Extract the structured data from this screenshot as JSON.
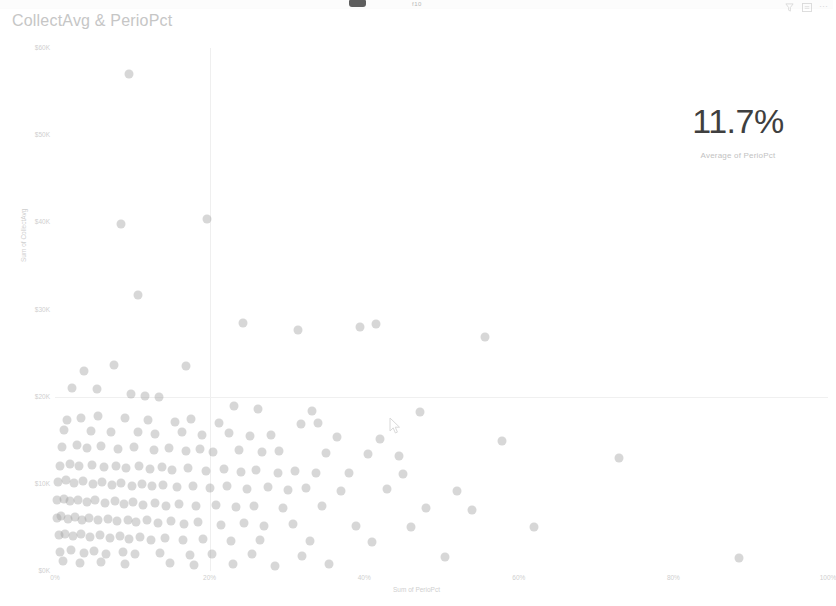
{
  "window": {
    "chrome_hint": "f10"
  },
  "visual": {
    "title": "CollectAvg & PerioPct",
    "header_icons": [
      {
        "name": "filter-icon",
        "glyph": "filter"
      },
      {
        "name": "focus-mode-icon",
        "glyph": "focus"
      },
      {
        "name": "more-options-icon",
        "glyph": "⋯"
      }
    ]
  },
  "kpi": {
    "value": "11.7%",
    "label": "Average of PerioPct"
  },
  "chart_data": {
    "type": "scatter",
    "title": "CollectAvg & PerioPct",
    "xlabel": "Sum of PerioPct",
    "ylabel": "Sum of CollectAvg",
    "xlim": [
      0,
      100
    ],
    "ylim": [
      0,
      60000
    ],
    "x_ticks": [
      0,
      20,
      40,
      60,
      80,
      100
    ],
    "x_tick_labels": [
      "0%",
      "20%",
      "40%",
      "60%",
      "80%",
      "100%"
    ],
    "y_ticks": [
      0,
      10000,
      20000,
      30000,
      40000,
      50000,
      60000
    ],
    "y_tick_labels": [
      "$0K",
      "$10K",
      "$20K",
      "$30K",
      "$40K",
      "$50K",
      "$60K"
    ],
    "grid": true,
    "legend": "none",
    "marker_color": "#9a9a9a",
    "marker_opacity": 0.4,
    "marker_size": 9,
    "points": [
      [
        9.6,
        57000
      ],
      [
        8.5,
        39800
      ],
      [
        19.7,
        40400
      ],
      [
        10.8,
        31700
      ],
      [
        24.3,
        28400
      ],
      [
        31.4,
        27600
      ],
      [
        39.5,
        28000
      ],
      [
        41.5,
        28300
      ],
      [
        55.6,
        26800
      ],
      [
        3.7,
        22900
      ],
      [
        7.6,
        23600
      ],
      [
        17.0,
        23500
      ],
      [
        2.2,
        21000
      ],
      [
        5.4,
        20900
      ],
      [
        9.8,
        20300
      ],
      [
        11.6,
        20100
      ],
      [
        13.5,
        20000
      ],
      [
        23.1,
        18900
      ],
      [
        26.3,
        18600
      ],
      [
        33.3,
        18400
      ],
      [
        47.2,
        18200
      ],
      [
        1.6,
        17300
      ],
      [
        3.3,
        17600
      ],
      [
        5.5,
        17800
      ],
      [
        9.0,
        17500
      ],
      [
        12.0,
        17300
      ],
      [
        15.5,
        17100
      ],
      [
        17.6,
        17400
      ],
      [
        21.2,
        17000
      ],
      [
        31.8,
        16900
      ],
      [
        34.0,
        17000
      ],
      [
        1.2,
        16200
      ],
      [
        4.6,
        16100
      ],
      [
        7.2,
        15900
      ],
      [
        10.7,
        16000
      ],
      [
        13.0,
        15700
      ],
      [
        16.4,
        15900
      ],
      [
        19.0,
        15600
      ],
      [
        22.5,
        15800
      ],
      [
        25.2,
        15500
      ],
      [
        28.0,
        15600
      ],
      [
        36.5,
        15400
      ],
      [
        42.0,
        15100
      ],
      [
        57.8,
        14900
      ],
      [
        0.9,
        14200
      ],
      [
        2.8,
        14400
      ],
      [
        4.2,
        14100
      ],
      [
        6.0,
        14300
      ],
      [
        8.2,
        14000
      ],
      [
        10.2,
        14200
      ],
      [
        12.8,
        13900
      ],
      [
        14.7,
        14100
      ],
      [
        16.9,
        13800
      ],
      [
        18.8,
        14000
      ],
      [
        20.5,
        13700
      ],
      [
        23.8,
        13900
      ],
      [
        26.8,
        13600
      ],
      [
        29.0,
        13800
      ],
      [
        35.0,
        13500
      ],
      [
        40.5,
        13400
      ],
      [
        44.5,
        13200
      ],
      [
        73.0,
        13000
      ],
      [
        0.6,
        12100
      ],
      [
        1.9,
        12300
      ],
      [
        3.1,
        12000
      ],
      [
        4.8,
        12200
      ],
      [
        6.3,
        11900
      ],
      [
        7.9,
        12100
      ],
      [
        9.2,
        11800
      ],
      [
        10.9,
        12000
      ],
      [
        12.3,
        11700
      ],
      [
        13.8,
        11900
      ],
      [
        15.2,
        11600
      ],
      [
        17.2,
        11800
      ],
      [
        19.5,
        11500
      ],
      [
        21.8,
        11700
      ],
      [
        24.0,
        11400
      ],
      [
        26.0,
        11600
      ],
      [
        28.8,
        11300
      ],
      [
        31.0,
        11500
      ],
      [
        33.8,
        11200
      ],
      [
        38.0,
        11300
      ],
      [
        45.0,
        11100
      ],
      [
        0.4,
        10200
      ],
      [
        1.4,
        10400
      ],
      [
        2.5,
        10100
      ],
      [
        3.6,
        10300
      ],
      [
        4.9,
        10000
      ],
      [
        6.1,
        10200
      ],
      [
        7.4,
        9900
      ],
      [
        8.6,
        10100
      ],
      [
        9.9,
        9800
      ],
      [
        11.2,
        10000
      ],
      [
        12.6,
        9700
      ],
      [
        14.0,
        9900
      ],
      [
        15.8,
        9600
      ],
      [
        17.9,
        9800
      ],
      [
        20.0,
        9500
      ],
      [
        22.2,
        9700
      ],
      [
        24.8,
        9400
      ],
      [
        27.5,
        9600
      ],
      [
        30.2,
        9300
      ],
      [
        32.5,
        9500
      ],
      [
        37.0,
        9200
      ],
      [
        43.0,
        9400
      ],
      [
        52.0,
        9200
      ],
      [
        0.3,
        8100
      ],
      [
        1.1,
        8300
      ],
      [
        2.0,
        8000
      ],
      [
        3.0,
        8200
      ],
      [
        4.1,
        7900
      ],
      [
        5.2,
        8100
      ],
      [
        6.5,
        7800
      ],
      [
        7.7,
        8000
      ],
      [
        8.9,
        7700
      ],
      [
        10.1,
        7900
      ],
      [
        11.4,
        7600
      ],
      [
        12.9,
        7800
      ],
      [
        14.4,
        7500
      ],
      [
        16.1,
        7700
      ],
      [
        18.2,
        7400
      ],
      [
        20.8,
        7600
      ],
      [
        23.4,
        7300
      ],
      [
        25.8,
        7500
      ],
      [
        29.5,
        7200
      ],
      [
        34.5,
        7400
      ],
      [
        48.0,
        7200
      ],
      [
        54.0,
        7000
      ],
      [
        0.2,
        6100
      ],
      [
        0.8,
        6300
      ],
      [
        1.7,
        6000
      ],
      [
        2.6,
        6200
      ],
      [
        3.5,
        5900
      ],
      [
        4.4,
        6100
      ],
      [
        5.6,
        5800
      ],
      [
        6.8,
        6000
      ],
      [
        8.0,
        5700
      ],
      [
        9.4,
        5900
      ],
      [
        10.5,
        5600
      ],
      [
        11.9,
        5800
      ],
      [
        13.3,
        5500
      ],
      [
        15.0,
        5700
      ],
      [
        16.7,
        5400
      ],
      [
        18.5,
        5600
      ],
      [
        21.5,
        5300
      ],
      [
        24.5,
        5500
      ],
      [
        27.0,
        5200
      ],
      [
        30.8,
        5400
      ],
      [
        39.0,
        5200
      ],
      [
        46.0,
        5000
      ],
      [
        62.0,
        5100
      ],
      [
        0.5,
        4100
      ],
      [
        1.3,
        4300
      ],
      [
        2.3,
        4000
      ],
      [
        3.4,
        4200
      ],
      [
        4.5,
        3900
      ],
      [
        5.8,
        4100
      ],
      [
        7.1,
        3800
      ],
      [
        8.4,
        4000
      ],
      [
        9.6,
        3700
      ],
      [
        11.0,
        3900
      ],
      [
        12.4,
        3600
      ],
      [
        14.2,
        3800
      ],
      [
        16.5,
        3500
      ],
      [
        19.2,
        3700
      ],
      [
        22.8,
        3400
      ],
      [
        26.5,
        3600
      ],
      [
        33.0,
        3400
      ],
      [
        41.0,
        3300
      ],
      [
        0.7,
        2200
      ],
      [
        2.1,
        2400
      ],
      [
        3.8,
        2100
      ],
      [
        5.0,
        2300
      ],
      [
        6.6,
        2000
      ],
      [
        8.8,
        2200
      ],
      [
        10.4,
        1900
      ],
      [
        13.6,
        2100
      ],
      [
        17.5,
        1800
      ],
      [
        20.3,
        2000
      ],
      [
        25.5,
        1900
      ],
      [
        32.0,
        1700
      ],
      [
        50.5,
        1600
      ],
      [
        88.5,
        1500
      ],
      [
        1.0,
        1100
      ],
      [
        3.2,
        900
      ],
      [
        5.9,
        1000
      ],
      [
        9.1,
        800
      ],
      [
        14.9,
        950
      ],
      [
        18.0,
        700
      ],
      [
        23.0,
        850
      ],
      [
        28.5,
        600
      ],
      [
        35.5,
        750
      ]
    ]
  }
}
